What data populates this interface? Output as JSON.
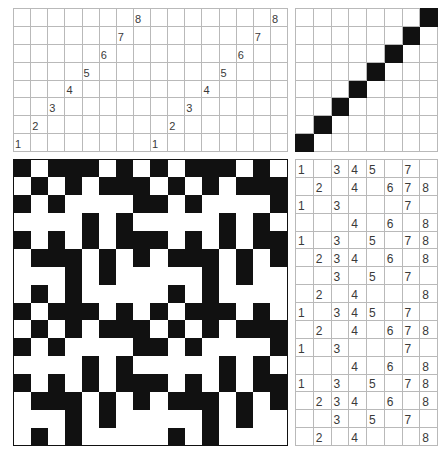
{
  "figure": {
    "background_color": "#ffffff",
    "ink_color": "#111111",
    "gridline_color": "#b9b9b9",
    "digit_color": "#3a3a3a"
  },
  "panels": {
    "sequence_wide": {
      "name": "top-left numbered sequence grid",
      "columns": 16,
      "rows": 8,
      "description": "Two repetitions of an ascending anti-diagonal staircase of digits 1 through 8",
      "cells": [
        [
          "",
          "",
          "",
          "",
          "",
          "",
          "",
          "8",
          "",
          "",
          "",
          "",
          "",
          "",
          "",
          "8"
        ],
        [
          "",
          "",
          "",
          "",
          "",
          "",
          "7",
          "",
          "",
          "",
          "",
          "",
          "",
          "",
          "7",
          ""
        ],
        [
          "",
          "",
          "",
          "",
          "",
          "6",
          "",
          "",
          "",
          "",
          "",
          "",
          "",
          "6",
          "",
          ""
        ],
        [
          "",
          "",
          "",
          "",
          "5",
          "",
          "",
          "",
          "",
          "",
          "",
          "",
          "5",
          "",
          "",
          ""
        ],
        [
          "",
          "",
          "",
          "4",
          "",
          "",
          "",
          "",
          "",
          "",
          "",
          "4",
          "",
          "",
          "",
          ""
        ],
        [
          "",
          "",
          "3",
          "",
          "",
          "",
          "",
          "",
          "",
          "",
          "3",
          "",
          "",
          "",
          "",
          ""
        ],
        [
          "",
          "2",
          "",
          "",
          "",
          "",
          "",
          "",
          "",
          "2",
          "",
          "",
          "",
          "",
          "",
          ""
        ],
        [
          "1",
          "",
          "",
          "",
          "",
          "",
          "",
          "",
          "1",
          "",
          "",
          "",
          "",
          "",
          "",
          ""
        ]
      ]
    },
    "diagonal": {
      "name": "top-right diagonal grid",
      "columns": 8,
      "rows": 8,
      "description": "Filled cells along the anti-diagonal from bottom-left to top-right",
      "cells": [
        [
          0,
          0,
          0,
          0,
          0,
          0,
          0,
          1
        ],
        [
          0,
          0,
          0,
          0,
          0,
          0,
          1,
          0
        ],
        [
          0,
          0,
          0,
          0,
          0,
          1,
          0,
          0
        ],
        [
          0,
          0,
          0,
          0,
          1,
          0,
          0,
          0
        ],
        [
          0,
          0,
          0,
          1,
          0,
          0,
          0,
          0
        ],
        [
          0,
          0,
          1,
          0,
          0,
          0,
          0,
          0
        ],
        [
          0,
          1,
          0,
          0,
          0,
          0,
          0,
          0
        ],
        [
          1,
          0,
          0,
          0,
          0,
          0,
          0,
          0
        ]
      ]
    },
    "pattern": {
      "name": "bottom-left binary pattern grid",
      "columns": 16,
      "rows": 16,
      "description": "An 8 by 8 black-and-white base tile repeated twice horizontally and twice vertically",
      "cells": [
        [
          1,
          0,
          1,
          1,
          1,
          0,
          1,
          0,
          1,
          0,
          1,
          1,
          1,
          0,
          1,
          0
        ],
        [
          0,
          1,
          0,
          1,
          0,
          1,
          1,
          1,
          0,
          1,
          0,
          1,
          0,
          1,
          1,
          1
        ],
        [
          1,
          0,
          1,
          0,
          0,
          0,
          0,
          1,
          1,
          0,
          1,
          0,
          0,
          0,
          0,
          1
        ],
        [
          0,
          0,
          0,
          0,
          1,
          0,
          1,
          0,
          0,
          0,
          0,
          0,
          1,
          0,
          1,
          0
        ],
        [
          1,
          0,
          1,
          0,
          1,
          0,
          1,
          1,
          1,
          0,
          1,
          0,
          1,
          0,
          1,
          1
        ],
        [
          0,
          1,
          1,
          1,
          0,
          1,
          0,
          1,
          0,
          1,
          1,
          1,
          0,
          1,
          0,
          1
        ],
        [
          0,
          0,
          0,
          1,
          0,
          1,
          0,
          0,
          0,
          0,
          0,
          1,
          0,
          1,
          0,
          0
        ],
        [
          0,
          1,
          0,
          1,
          0,
          0,
          0,
          0,
          0,
          1,
          0,
          1,
          0,
          0,
          0,
          0
        ],
        [
          1,
          0,
          1,
          1,
          1,
          0,
          1,
          0,
          1,
          0,
          1,
          1,
          1,
          0,
          1,
          0
        ],
        [
          0,
          1,
          0,
          1,
          0,
          1,
          1,
          1,
          0,
          1,
          0,
          1,
          0,
          1,
          1,
          1
        ],
        [
          1,
          0,
          1,
          0,
          0,
          0,
          0,
          1,
          1,
          0,
          1,
          0,
          0,
          0,
          0,
          1
        ],
        [
          0,
          0,
          0,
          0,
          1,
          0,
          1,
          0,
          0,
          0,
          0,
          0,
          1,
          0,
          1,
          0
        ],
        [
          1,
          0,
          1,
          0,
          1,
          0,
          1,
          1,
          1,
          0,
          1,
          0,
          1,
          0,
          1,
          1
        ],
        [
          0,
          1,
          1,
          1,
          0,
          1,
          0,
          1,
          0,
          1,
          1,
          1,
          0,
          1,
          0,
          1
        ],
        [
          0,
          0,
          0,
          1,
          0,
          1,
          0,
          0,
          0,
          0,
          0,
          1,
          0,
          1,
          0,
          0
        ],
        [
          0,
          1,
          0,
          1,
          0,
          0,
          0,
          0,
          0,
          1,
          0,
          1,
          0,
          0,
          0,
          0
        ]
      ]
    },
    "sequence_tall": {
      "name": "bottom-right numbered grid",
      "columns": 8,
      "rows": 16,
      "description": "An 8-row block of digit patterns repeated twice vertically",
      "cells": [
        [
          "1",
          "",
          "3",
          "4",
          "5",
          "",
          "7",
          ""
        ],
        [
          "",
          "2",
          "",
          "4",
          "",
          "6",
          "7",
          "8"
        ],
        [
          "1",
          "",
          "3",
          "",
          "",
          "",
          "7",
          ""
        ],
        [
          "",
          "",
          "",
          "4",
          "",
          "6",
          "",
          "8"
        ],
        [
          "1",
          "",
          "3",
          "",
          "5",
          "",
          "7",
          "8"
        ],
        [
          "",
          "2",
          "3",
          "4",
          "",
          "6",
          "",
          "8"
        ],
        [
          "",
          "",
          "3",
          "",
          "5",
          "",
          "7",
          ""
        ],
        [
          "",
          "2",
          "",
          "4",
          "",
          "",
          "",
          "8"
        ],
        [
          "1",
          "",
          "3",
          "4",
          "5",
          "",
          "7",
          ""
        ],
        [
          "",
          "2",
          "",
          "4",
          "",
          "6",
          "7",
          "8"
        ],
        [
          "1",
          "",
          "3",
          "",
          "",
          "",
          "7",
          ""
        ],
        [
          "",
          "",
          "",
          "4",
          "",
          "6",
          "",
          "8"
        ],
        [
          "1",
          "",
          "3",
          "",
          "5",
          "",
          "7",
          "8"
        ],
        [
          "",
          "2",
          "3",
          "4",
          "",
          "6",
          "",
          "8"
        ],
        [
          "",
          "",
          "3",
          "",
          "5",
          "",
          "7",
          ""
        ],
        [
          "",
          "2",
          "",
          "4",
          "",
          "",
          "",
          "8"
        ]
      ]
    }
  }
}
